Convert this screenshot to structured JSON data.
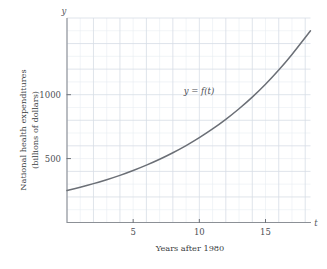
{
  "chart_data": {
    "type": "line",
    "title": "",
    "xlabel": "Years after 1980",
    "ylabel_line1": "National health expenditures",
    "ylabel_line2": "(billions of dollars)",
    "x_axis_symbol": "t",
    "y_axis_symbol": "y",
    "curve_label": "y = f(t)",
    "curve_color": "#6b6f76",
    "grid": true,
    "grid_color": "#d7dde6",
    "grid_minor_color": "#e7ecf2",
    "legend_position": "inline-annotation",
    "xlim": [
      0,
      18.4
    ],
    "ylim": [
      0,
      1600
    ],
    "xticks": [
      5,
      10,
      15
    ],
    "xtick_labels": [
      "5",
      "10",
      "15"
    ],
    "yticks": [
      500,
      1000
    ],
    "ytick_labels": [
      "500",
      "1000"
    ],
    "x_minor_step": 1,
    "y_minor_step": 100,
    "x": [
      0,
      1,
      2,
      3,
      4,
      5,
      6,
      7,
      8,
      9,
      10,
      11,
      12,
      13,
      14,
      15,
      16,
      17,
      18.4
    ],
    "values": [
      250,
      276,
      304,
      335,
      369,
      407,
      449,
      495,
      546,
      602,
      664,
      732,
      807,
      890,
      981,
      1082,
      1193,
      1315,
      1500
    ],
    "series": [
      {
        "name": "y = f(t)",
        "values": [
          250,
          276,
          304,
          335,
          369,
          407,
          449,
          495,
          546,
          602,
          664,
          732,
          807,
          890,
          981,
          1082,
          1193,
          1315,
          1500
        ]
      }
    ]
  }
}
